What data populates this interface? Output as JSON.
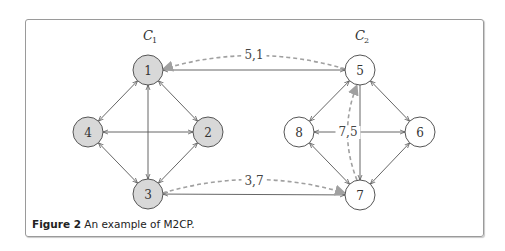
{
  "figure": {
    "caption_label": "Figure 2",
    "caption_text": " An example of M2CP."
  },
  "clusters": [
    {
      "id": "C1",
      "label": "C",
      "sub": "1",
      "x": 148,
      "y": 40
    },
    {
      "id": "C2",
      "label": "C",
      "sub": "2",
      "x": 360,
      "y": 40
    }
  ],
  "colors": {
    "shaded_node_fill": "#d8d8d8",
    "plain_node_fill": "#ffffff",
    "node_stroke": "#555555",
    "edge_stroke": "#555555",
    "dashed_edge_stroke": "#a0a0a0"
  },
  "nodes": [
    {
      "id": "1",
      "label": "1",
      "x": 148,
      "y": 70,
      "shaded": true
    },
    {
      "id": "2",
      "label": "2",
      "x": 208,
      "y": 132,
      "shaded": true
    },
    {
      "id": "3",
      "label": "3",
      "x": 148,
      "y": 194,
      "shaded": true
    },
    {
      "id": "4",
      "label": "4",
      "x": 88,
      "y": 132,
      "shaded": true
    },
    {
      "id": "5",
      "label": "5",
      "x": 360,
      "y": 70,
      "shaded": false
    },
    {
      "id": "6",
      "label": "6",
      "x": 420,
      "y": 132,
      "shaded": false
    },
    {
      "id": "7",
      "label": "7",
      "x": 360,
      "y": 195,
      "shaded": false
    },
    {
      "id": "8",
      "label": "8",
      "x": 299,
      "y": 132,
      "shaded": false
    }
  ],
  "edges": [
    {
      "from": "1",
      "to": "4",
      "bidirectional": true
    },
    {
      "from": "1",
      "to": "2",
      "bidirectional": true
    },
    {
      "from": "4",
      "to": "2",
      "bidirectional": true
    },
    {
      "from": "1",
      "to": "3",
      "bidirectional": true
    },
    {
      "from": "4",
      "to": "3",
      "bidirectional": true
    },
    {
      "from": "2",
      "to": "3",
      "bidirectional": true
    },
    {
      "from": "5",
      "to": "8",
      "bidirectional": true
    },
    {
      "from": "5",
      "to": "6",
      "bidirectional": true
    },
    {
      "from": "8",
      "to": "6",
      "bidirectional": true
    },
    {
      "from": "5",
      "to": "7",
      "bidirectional": false
    },
    {
      "from": "8",
      "to": "7",
      "bidirectional": true
    },
    {
      "from": "6",
      "to": "7",
      "bidirectional": true
    },
    {
      "from": "1",
      "to": "5",
      "bidirectional": true
    },
    {
      "from": "3",
      "to": "7",
      "bidirectional": true
    }
  ],
  "dashed_edges": [
    {
      "from": "5",
      "to": "1",
      "label": "5,1",
      "label_x": 254,
      "label_y": 59
    },
    {
      "from": "3",
      "to": "7",
      "label": "3,7",
      "label_x": 254,
      "label_y": 185
    },
    {
      "from": "7",
      "to": "5",
      "label": "7,5",
      "label_x": 348,
      "label_y": 136
    }
  ]
}
